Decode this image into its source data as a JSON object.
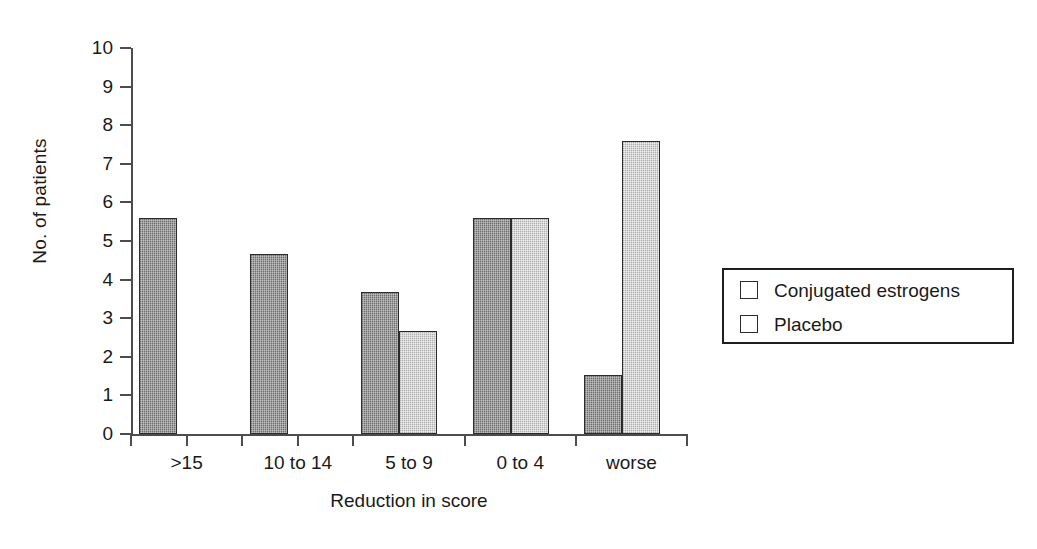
{
  "chart_data": {
    "type": "bar",
    "title": "",
    "xlabel": "Reduction in score",
    "ylabel": "No. of patients",
    "categories": [
      ">15",
      "10 to 14",
      "5 to 9",
      "0 to 4",
      "worse"
    ],
    "series": [
      {
        "name": "Conjugated estrogens",
        "color": "#8d8d8d",
        "values": [
          5.6,
          4.66,
          3.68,
          5.6,
          1.53
        ]
      },
      {
        "name": "Placebo",
        "color": "#c9c9c9",
        "values": [
          0,
          0,
          2.67,
          5.6,
          7.6
        ]
      }
    ],
    "ylim": [
      0,
      10
    ],
    "ytick_values": [
      0,
      1,
      2,
      3,
      4,
      5,
      6,
      7,
      8,
      9,
      10
    ],
    "ytick_labels": [
      "0",
      "1",
      "2",
      "3",
      "4",
      "5",
      "6",
      "7",
      "8",
      "9",
      "10"
    ],
    "grid": false,
    "legend_position": "right",
    "legend_entries": [
      "Conjugated estrogens",
      "Placebo"
    ]
  },
  "axes": {
    "y_title": "No. of patients",
    "x_title": "Reduction in score"
  },
  "legend": {
    "items": [
      {
        "label": "Conjugated estrogens",
        "swatch": "series0-swatch"
      },
      {
        "label": "Placebo",
        "swatch": "series1-swatch"
      }
    ]
  }
}
